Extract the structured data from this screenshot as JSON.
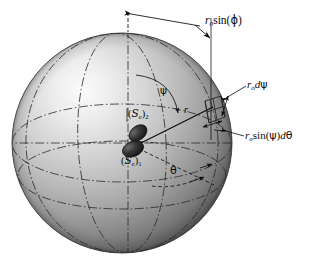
{
  "figure": {
    "type": "technical-diagram",
    "background_color": "#ffffff",
    "ink_color": "#0a0a0a",
    "sphere": {
      "center_x": 122,
      "center_y": 143,
      "radius": 110,
      "highlight_color": "#f2f2f2",
      "midtone_color": "#9a9a9a",
      "shadow_color": "#4a4a4a",
      "outline_color": "#2a2a2a"
    },
    "source_blobs": [
      {
        "name": "upper-blob",
        "cx": 138,
        "cy": 133,
        "rx": 10,
        "ry": 7,
        "rotation": -38,
        "fill": "#2d2d2d"
      },
      {
        "name": "lower-blob",
        "cx": 133,
        "cy": 149,
        "rx": 11,
        "ry": 7.5,
        "rotation": -22,
        "fill": "#242424"
      }
    ]
  },
  "labels": {
    "ro_sin_phi": {
      "name": "r-sub-o-sin-phi",
      "r": "r",
      "sub_o": "o",
      "sin": "sin(",
      "phi": "ϕ",
      "close": ")"
    },
    "ro_d_psi": {
      "name": "r-sub-o-d-psi",
      "r": "r",
      "sub_o": "o",
      "d": "d",
      "psi": "ψ"
    },
    "ro_sin_psi_d_theta": {
      "name": "r-sub-o-sin-psi-d-theta",
      "r": "r",
      "sub_o": "o",
      "sin": "sin(",
      "psi": "ψ",
      "close": ")",
      "d": "d",
      "theta": "θ"
    },
    "psi_angle": {
      "name": "psi-angle",
      "text": "ψ"
    },
    "theta_angle": {
      "name": "theta-angle",
      "text": "θ"
    },
    "radius_r": {
      "name": "radius-r",
      "text": "r"
    },
    "source_2": {
      "name": "source-e-2",
      "open": "(",
      "s": "S",
      "sub_e": "e",
      "close": ")",
      "sub_index": "2"
    },
    "source_1": {
      "name": "source-e-1",
      "open": "(",
      "s": "S",
      "sub_e": "e",
      "close": ")",
      "sub_index": "1"
    }
  },
  "geometry_notes": {
    "equator_style": "dash-dot",
    "meridian_style": "dash-dot",
    "theta_arc_style": "dashed",
    "radial_ray_style": "solid",
    "dimension_line_style": "solid-with-arrowheads"
  }
}
